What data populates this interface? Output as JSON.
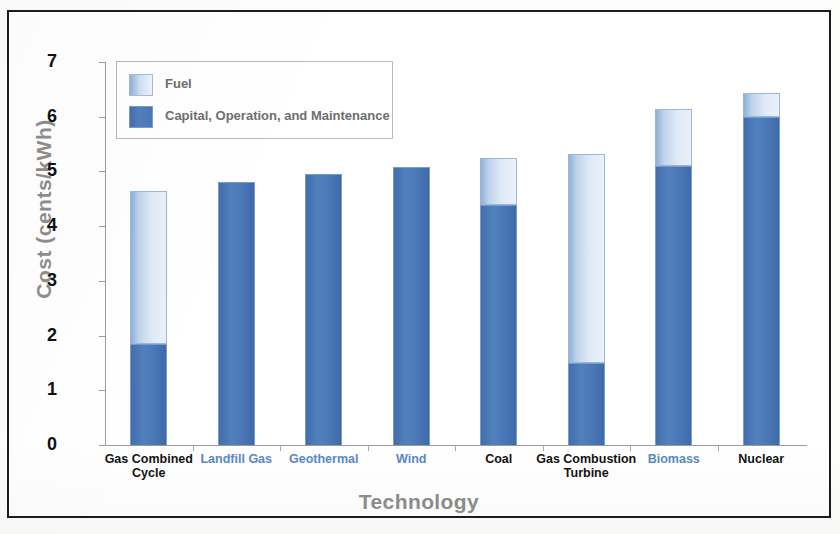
{
  "chart_data": {
    "type": "bar",
    "stacked": true,
    "title": "",
    "xlabel": "Technology",
    "ylabel": "Cost (cents/kWh)",
    "ylim": [
      0,
      7
    ],
    "yticks": [
      0,
      1,
      2,
      3,
      4,
      5,
      6,
      7
    ],
    "grid": false,
    "legend_position": "top-left",
    "categories": [
      "Gas Combined Cycle",
      "Landfill Gas",
      "Geothermal",
      "Wind",
      "Coal",
      "Gas Combustion Turbine",
      "Biomass",
      "Nuclear"
    ],
    "category_label_colors": [
      "#121212",
      "#5b87c6",
      "#5b87c6",
      "#5b87c6",
      "#121212",
      "#121212",
      "#5b87c6",
      "#121212"
    ],
    "series": [
      {
        "name": "Capital, Operation, and Maintenance",
        "color": "#4a76b6",
        "values": [
          1.85,
          4.8,
          4.96,
          5.08,
          4.38,
          1.5,
          5.1,
          6.0
        ]
      },
      {
        "name": "Fuel",
        "color": "#dfeaf6",
        "values": [
          2.8,
          0.0,
          0.0,
          0.0,
          0.87,
          3.82,
          1.05,
          0.43
        ]
      }
    ],
    "totals": [
      4.65,
      4.8,
      4.96,
      5.08,
      5.25,
      5.32,
      6.15,
      6.43
    ]
  },
  "legend": {
    "items": [
      {
        "label": "Fuel",
        "swatch": "fuel"
      },
      {
        "label": "Capital, Operation, and Maintenance",
        "swatch": "com"
      }
    ]
  },
  "axes": {
    "y_title": "Cost (cents/kWh)",
    "x_title": "Technology",
    "y_tick_labels": [
      "7",
      "6",
      "5",
      "4",
      "3",
      "2",
      "1",
      "0"
    ]
  },
  "colors": {
    "bar_capital": "#4a76b6",
    "bar_fuel_light": "#eaf2fa",
    "bar_fuel_dark": "#8fb1d8",
    "axis_title": "#8d8d8d",
    "category_blue": "#5b87c6",
    "frame": "#1d1d1d"
  }
}
